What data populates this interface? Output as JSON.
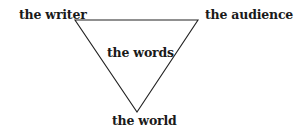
{
  "diagram": {
    "type": "inverted-triangle",
    "vertices": {
      "top_left": "the writer",
      "top_right": "the audience",
      "bottom": "the world"
    },
    "center": "the words",
    "line_color": "#222222",
    "text_color": "#1a1a1a"
  }
}
